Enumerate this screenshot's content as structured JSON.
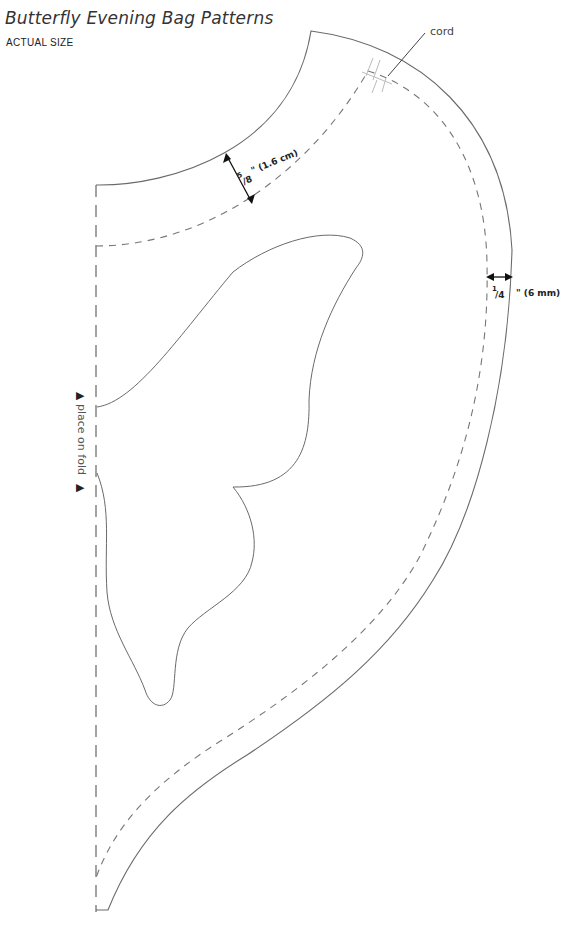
{
  "header": {
    "title": "Butterfly Evening Bag Patterns",
    "subtitle": "ACTUAL SIZE"
  },
  "labels": {
    "cord": "cord",
    "seam_top_num": "5",
    "seam_top_den": "/8",
    "seam_top_rest": "\" (1.6 cm)",
    "seam_side_num": "1",
    "seam_side_den": "/4",
    "seam_side_rest": "\" (6 mm)",
    "fold": "place on fold",
    "fold_marker": "▶"
  },
  "colors": {
    "cut_line": "#6a6a6a",
    "seam_line": "#777777",
    "text": "#333333"
  }
}
